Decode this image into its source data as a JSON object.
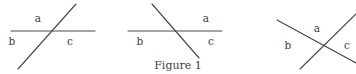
{
  "figure": {
    "caption": "Figure 1",
    "caption_position": {
      "x": 178,
      "y": 65
    },
    "canvas": {
      "width": 356,
      "height": 74
    },
    "stroke_color": "#4a4a4a",
    "text_color": "#3d3d3d",
    "background_color": "#ffffff"
  },
  "diagrams": [
    {
      "id": "diagram-left",
      "description": "Transversal rising left-to-right crossing a horizontal line",
      "lines": [
        {
          "name": "horizontal-line",
          "x1": 11,
          "y1": 31,
          "x2": 95,
          "y2": 31
        },
        {
          "name": "diagonal-line",
          "x1": 18,
          "y1": 69,
          "x2": 76,
          "y2": 4
        }
      ],
      "intersection": {
        "x": 51,
        "y": 31
      },
      "labels": [
        {
          "text": "a",
          "x": 38,
          "y": 18
        },
        {
          "text": "b",
          "x": 12,
          "y": 41
        },
        {
          "text": "c",
          "x": 70,
          "y": 41
        }
      ]
    },
    {
      "id": "diagram-middle",
      "description": "Transversal falling left-to-right crossing a horizontal line",
      "lines": [
        {
          "name": "horizontal-line",
          "x1": 128,
          "y1": 31,
          "x2": 222,
          "y2": 31
        },
        {
          "name": "diagonal-line",
          "x1": 152,
          "y1": 4,
          "x2": 199,
          "y2": 58
        }
      ],
      "intersection": {
        "x": 175,
        "y": 31
      },
      "labels": [
        {
          "text": "a",
          "x": 206,
          "y": 18
        },
        {
          "text": "b",
          "x": 140,
          "y": 41
        },
        {
          "text": "c",
          "x": 211,
          "y": 41
        }
      ]
    },
    {
      "id": "diagram-right",
      "description": "Two diagonal lines crossing in an X",
      "lines": [
        {
          "name": "descending-line",
          "x1": 277,
          "y1": 20,
          "x2": 356,
          "y2": 63
        },
        {
          "name": "ascending-line",
          "x1": 300,
          "y1": 69,
          "x2": 356,
          "y2": 14
        }
      ],
      "intersection": {
        "x": 323,
        "y": 45
      },
      "labels": [
        {
          "text": "a",
          "x": 317,
          "y": 28
        },
        {
          "text": "b",
          "x": 288,
          "y": 45
        },
        {
          "text": "c",
          "x": 347,
          "y": 45
        }
      ]
    }
  ]
}
